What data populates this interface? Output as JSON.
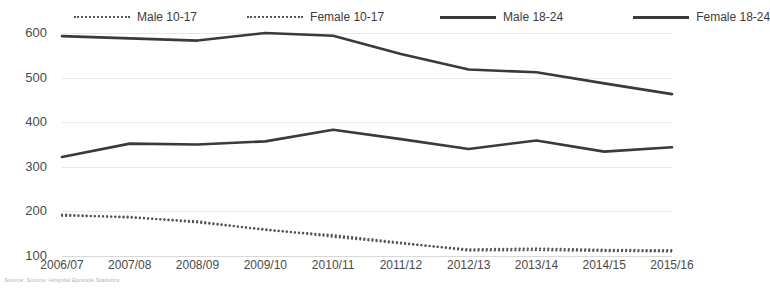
{
  "chart_data": {
    "type": "line",
    "title": "",
    "subtitle": "",
    "xlabel": "",
    "ylabel": "",
    "ylim": [
      100,
      600
    ],
    "yticks": [
      100,
      200,
      300,
      400,
      500,
      600
    ],
    "grid": true,
    "legend_position": "top",
    "categories": [
      "2006/07",
      "2007/08",
      "2008/09",
      "2009/10",
      "2010/11",
      "2011/12",
      "2012/13",
      "2013/14",
      "2014/15",
      "2015/16"
    ],
    "series": [
      {
        "name": "Male 10-17",
        "style": "dotted",
        "color": "#555555",
        "values": [
          190,
          188,
          175,
          160,
          143,
          128,
          115,
          117,
          114,
          113
        ]
      },
      {
        "name": "Female 10-17",
        "style": "dotted",
        "color": "#555555",
        "values": [
          193,
          186,
          178,
          158,
          147,
          130,
          112,
          113,
          111,
          110
        ]
      },
      {
        "name": "Male 18-24",
        "style": "solid",
        "color": "#3a3a3a",
        "values": [
          593,
          588,
          583,
          600,
          594,
          553,
          518,
          512,
          487,
          463
        ]
      },
      {
        "name": "Female 18-24",
        "style": "solid",
        "color": "#3a3a3a",
        "values": [
          322,
          352,
          350,
          357,
          383,
          362,
          340,
          359,
          334,
          344
        ]
      }
    ],
    "source": "Source: Source: Hospital Episode Statistics"
  },
  "legend": {
    "items": [
      {
        "label": "Male 10-17"
      },
      {
        "label": "Female 10-17"
      },
      {
        "label": "Male 18-24"
      },
      {
        "label": "Female 18-24"
      }
    ]
  },
  "axes": {
    "y_labels": [
      "600",
      "500",
      "400",
      "300",
      "200",
      "100"
    ],
    "x_labels": [
      "2006/07",
      "2007/08",
      "2008/09",
      "2009/10",
      "2010/11",
      "2011/12",
      "2012/13",
      "2013/14",
      "2014/15",
      "2015/16"
    ]
  },
  "footer": {
    "source": "Source: Source: Hospital Episode Statistics"
  }
}
